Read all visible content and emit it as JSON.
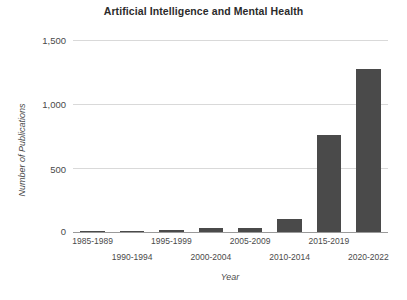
{
  "chart_data": {
    "type": "bar",
    "title": "Artificial Intelligence and Mental Health",
    "xlabel": "Year",
    "ylabel": "Number of Publications",
    "categories": [
      "1985-1989",
      "1990-1994",
      "1995-1999",
      "2000-2004",
      "2005-2009",
      "2010-2014",
      "2015-2019",
      "2020-2022"
    ],
    "values": [
      5,
      10,
      18,
      30,
      35,
      100,
      760,
      1270
    ],
    "ylim": [
      0,
      1500
    ],
    "yticks": [
      0,
      500,
      1000,
      1500
    ],
    "ytick_labels": [
      "0",
      "500",
      "1,000",
      "1,500"
    ],
    "grid": true,
    "legend": false,
    "bar_color": "#4a4a4a",
    "grid_color": "#d9d9d9",
    "axis_color": "#9a9a9a",
    "background": "#ffffff"
  },
  "axes": {
    "y_tick_0": "0",
    "y_tick_1": "500",
    "y_tick_2": "1,000",
    "y_tick_3": "1,500",
    "x_tick_0": "1985-1989",
    "x_tick_1": "1990-1994",
    "x_tick_2": "1995-1999",
    "x_tick_3": "2000-2004",
    "x_tick_4": "2005-2009",
    "x_tick_5": "2010-2014",
    "x_tick_6": "2015-2019",
    "x_tick_7": "2020-2022"
  }
}
